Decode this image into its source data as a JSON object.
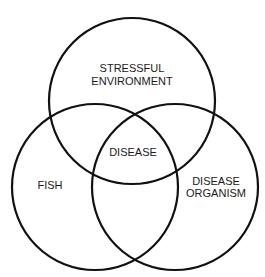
{
  "diagram": {
    "type": "venn",
    "circles": [
      {
        "id": "stressful-environment",
        "label_lines": [
          "STRESSFUL",
          "ENVIRONMENT"
        ],
        "cx": 132,
        "cy": 101,
        "r": 83
      },
      {
        "id": "fish",
        "label_lines": [
          "FISH"
        ],
        "cx": 95,
        "cy": 187,
        "r": 83
      },
      {
        "id": "disease-organism",
        "label_lines": [
          "DISEASE",
          "ORGANISM"
        ],
        "cx": 175,
        "cy": 187,
        "r": 83
      }
    ],
    "intersection_label": "DISEASE",
    "stroke_color": "#111111"
  }
}
